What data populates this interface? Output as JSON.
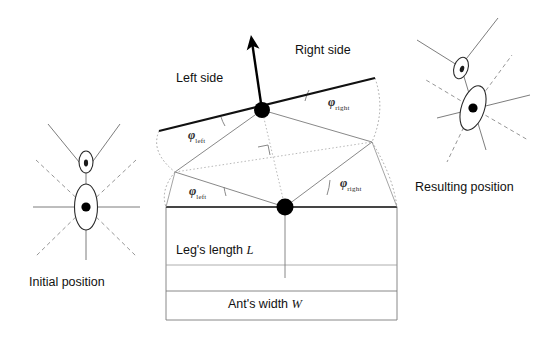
{
  "figure": {
    "title_alt": "Ant rotation geometry diagram",
    "captions": {
      "initial": "Initial position",
      "resulting": "Resulting position"
    },
    "side_labels": {
      "left": "Left side",
      "right": "Right side"
    },
    "angles": [
      {
        "id": "phi-left-upper",
        "symbol": "φ",
        "subscript": "left",
        "x": 188,
        "y": 128
      },
      {
        "id": "phi-right-upper",
        "symbol": "φ",
        "subscript": "right",
        "x": 328,
        "y": 95
      },
      {
        "id": "phi-left-lower",
        "symbol": "φ",
        "subscript": "left",
        "x": 189,
        "y": 184
      },
      {
        "id": "phi-right-lower",
        "symbol": "φ",
        "subscript": "right",
        "x": 340,
        "y": 176
      }
    ],
    "dimensions": {
      "leg_length": {
        "text": "Leg's length",
        "symbol": "L"
      },
      "ant_width": {
        "text": "Ant's width",
        "symbol": "W"
      }
    },
    "colors": {
      "ink": "#1a1a1a",
      "bold_stroke": "#000000",
      "thin_stroke": "#6e6e6e",
      "dotted_stroke": "#9a9a9a",
      "dashed_leg": "#8a8a8a",
      "body_fill": "#ffffff",
      "dot_fill": "#000000",
      "background": "#ffffff"
    },
    "geometry": {
      "pivot_upper": {
        "x": 262,
        "y": 110
      },
      "pivot_lower": {
        "x": 285,
        "y": 207
      },
      "bold_line": {
        "x1": 159,
        "y1": 131,
        "x2": 375,
        "y2": 78
      },
      "baseline": {
        "x1": 166,
        "y1": 207,
        "x2": 397,
        "y2": 207
      },
      "heading_arrow": {
        "x1": 262,
        "y1": 110,
        "x2": 250,
        "y2": 37
      },
      "box": {
        "left": 166,
        "right": 397,
        "top": 207,
        "mid": 265,
        "bottom": 291
      }
    }
  }
}
